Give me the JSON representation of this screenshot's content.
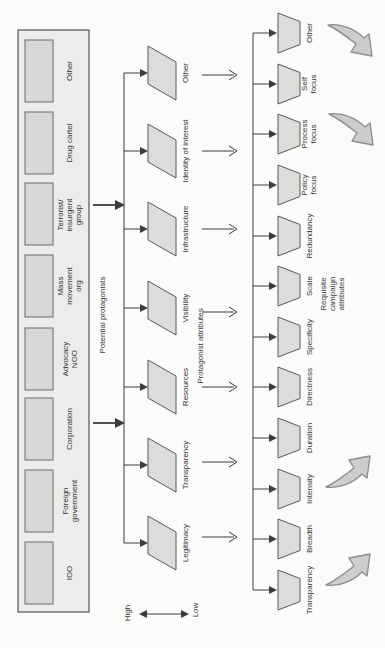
{
  "colors": {
    "background": "#fbfbf9",
    "box_fill": "#ececea",
    "cell_fill": "#d8d8d6",
    "shape_fill": "#dcdcda",
    "shape_stroke": "#58585c",
    "line": "#3c3c40",
    "text": "#333333",
    "swoosh_fill": "#cdcdcb",
    "swoosh_stroke": "#8e8e8e"
  },
  "protagonists": {
    "group_label": "Potential protagonists",
    "items": [
      {
        "label": "Other"
      },
      {
        "label": "Drug cartel"
      },
      {
        "label": "Terrorist/\ninsurgent\ngroup"
      },
      {
        "label": "Mass\nmovement\norg"
      },
      {
        "label": "Advocacy\nNGO"
      },
      {
        "label": "Corporation"
      },
      {
        "label": "Foreign\ngovernment"
      },
      {
        "label": "IGO"
      }
    ]
  },
  "protagonist_attributes": {
    "group_label": "Protagonist attributes",
    "items": [
      "Other",
      "Identity of interest",
      "Infrastructure",
      "Visibility",
      "Resources",
      "Transparency",
      "Legitimacy"
    ]
  },
  "campaign_attributes": {
    "group_label": "Requisite campaign attributes",
    "items": [
      "Other",
      "Self\nfocus",
      "Process\nfocus",
      "Policy\nfocus",
      "Redundancy",
      "Scale",
      "Specificity",
      "Directness",
      "Duration",
      "Intensity",
      "Breadth",
      "Transparency"
    ]
  },
  "scale": {
    "high_label": "High",
    "low_label": "Low"
  }
}
